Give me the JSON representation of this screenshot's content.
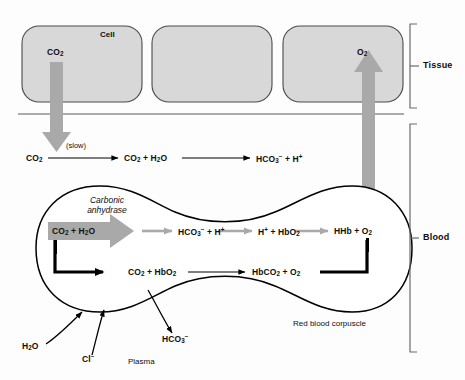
{
  "figure": {
    "regions": {
      "tissue_label": "Tissue",
      "blood_label": "Blood"
    }
  },
  "tissue": {
    "cell_label": "Cell",
    "co2_label": "CO2",
    "o2_label": "O2",
    "cells": [
      {
        "name": "cell-left"
      },
      {
        "name": "cell-middle"
      },
      {
        "name": "cell-right"
      }
    ]
  },
  "plasma": {
    "label": "Plasma",
    "reaction": {
      "rate_note": "(slow)",
      "step1": "CO2",
      "step2": "CO2 + H2O",
      "step3": "HCO3- + H+"
    },
    "inputs": [
      {
        "label": "H2O",
        "name": "water-influx"
      },
      {
        "label": "Cl-",
        "name": "chloride-influx"
      }
    ],
    "outputs": [
      {
        "label": "HCO3-",
        "name": "bicarbonate-efflux"
      }
    ]
  },
  "corpuscle": {
    "label": "Red blood corpuscle",
    "enzyme": "Carbonic anhydrase",
    "chain_upper": {
      "step1": "CO2 + H2O",
      "step2": "HCO3- + H+",
      "step3": "H+ + HbO2",
      "step4": "HHb + O2"
    },
    "chain_lower": {
      "step1": "CO2 + HbO2",
      "step2": "HbCO2 + O2"
    }
  },
  "colors": {
    "cell_fill": "#d8d8d8",
    "cell_stroke": "#4a4a4a",
    "gray_arrow": "#a9a9a9",
    "black_line": "#000000",
    "thin_line": "#5a5a5a",
    "text": "#0e0e0e"
  }
}
